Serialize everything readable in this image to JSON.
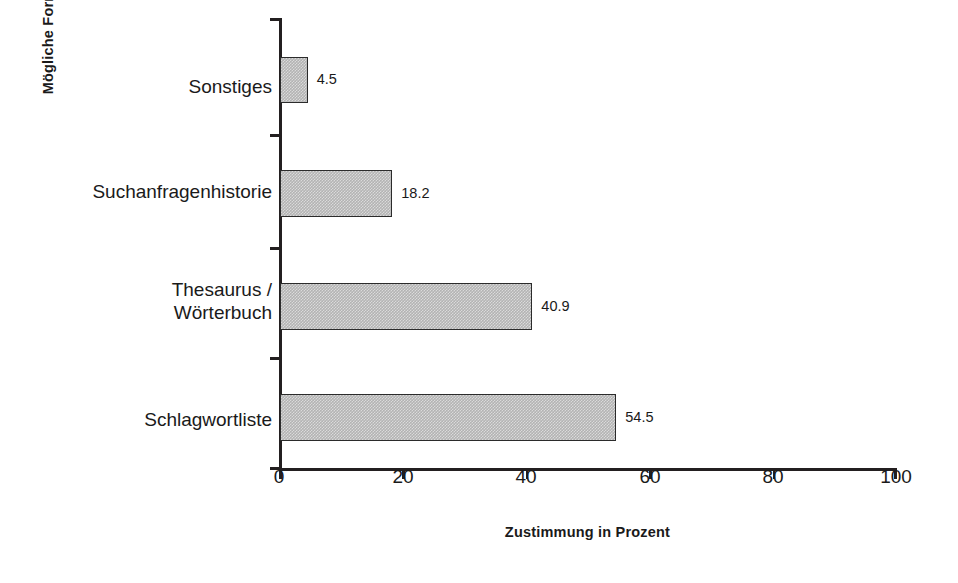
{
  "chart_data": {
    "type": "bar",
    "orientation": "horizontal",
    "title": "",
    "xlabel": "Zustimmung in Prozent",
    "ylabel": "Mögliche Formulierungshilfen",
    "categories": [
      "Schlagwortliste",
      "Thesaurus / Wörterbuch",
      "Suchanfragenhistorie",
      "Sonstiges"
    ],
    "values": [
      54.5,
      40.9,
      18.2,
      4.5
    ],
    "value_labels": [
      "54.5",
      "40.9",
      "18.2",
      "4.5"
    ],
    "xlim": [
      0,
      100
    ],
    "xticks": [
      0,
      20,
      40,
      60,
      80,
      100
    ],
    "xtick_labels": [
      "0",
      "20",
      "40",
      "60",
      "80",
      "100"
    ],
    "grid": false,
    "legend": false,
    "bar_fill": "#b3b3b3",
    "bar_border": "#2b2b2b",
    "axis_color": "#231f20",
    "text_color": "#1a1a1a",
    "background": "#ffffff"
  },
  "axes": {
    "x_title": "Zustimmung in Prozent",
    "y_title": "Mögliche Formulierungshilfen",
    "x_tick_labels": [
      "0",
      "20",
      "40",
      "60",
      "80",
      "100"
    ]
  },
  "bars": [
    {
      "label_line1": "Sonstiges",
      "label_line2": "",
      "value": 4.5,
      "value_label": "4.5"
    },
    {
      "label_line1": "Suchanfragenhistorie",
      "label_line2": "",
      "value": 18.2,
      "value_label": "18.2"
    },
    {
      "label_line1": "Thesaurus /",
      "label_line2": "Wörterbuch",
      "value": 40.9,
      "value_label": "40.9"
    },
    {
      "label_line1": "Schlagwortliste",
      "label_line2": "",
      "value": 54.5,
      "value_label": "54.5"
    }
  ]
}
